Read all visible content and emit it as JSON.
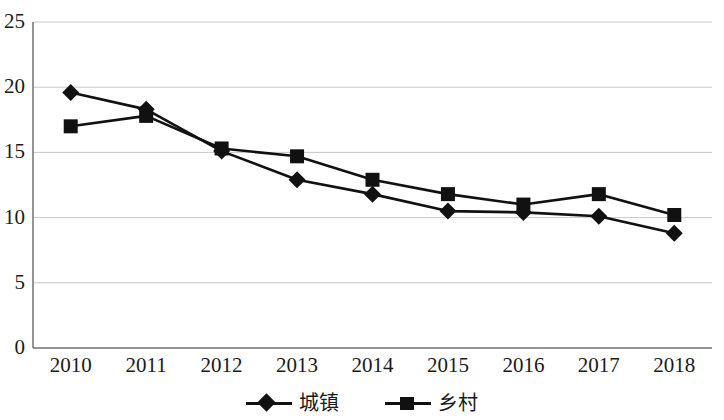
{
  "chart_data": {
    "type": "line",
    "title": "",
    "subtitle": "",
    "xlabel": "",
    "ylabel": "",
    "categories": [
      "2010",
      "2011",
      "2012",
      "2013",
      "2014",
      "2015",
      "2016",
      "2017",
      "2018"
    ],
    "series": [
      {
        "name": "城镇",
        "marker": "diamond",
        "color": "#111111",
        "values": [
          19.6,
          18.3,
          15.1,
          12.9,
          11.8,
          10.5,
          10.4,
          10.1,
          8.8
        ]
      },
      {
        "name": "乡村",
        "marker": "square",
        "color": "#111111",
        "values": [
          17.0,
          17.8,
          15.3,
          14.7,
          12.9,
          11.8,
          11.0,
          11.8,
          10.2
        ]
      }
    ],
    "ylim": [
      0,
      25
    ],
    "yticks": [
      0,
      5,
      10,
      15,
      20,
      25
    ],
    "ytick_labels": [
      "0",
      "5",
      "10",
      "15",
      "20",
      "25"
    ],
    "xtick_labels": [
      "2010",
      "2011",
      "2012",
      "2013",
      "2014",
      "2015",
      "2016",
      "2017",
      "2018"
    ],
    "grid": true,
    "grid_axis": "y",
    "grid_color": "#c8c8c8",
    "axis_color": "#7a7a7a",
    "legend_position": "bottom",
    "legend": [
      "城镇",
      "乡村"
    ]
  }
}
